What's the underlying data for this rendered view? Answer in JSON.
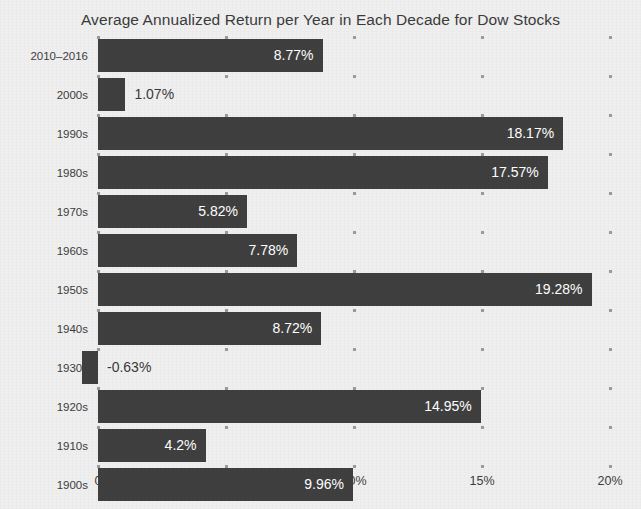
{
  "chart_data": {
    "type": "bar",
    "orientation": "horizontal",
    "title": "Average Annualized Return per Year in Each Decade for Dow Stocks",
    "xlabel": "",
    "ylabel": "",
    "xlim": [
      0,
      20
    ],
    "grid": "dotted-vertical",
    "legend": "none",
    "bar_color": "#3f3f3f",
    "background_color": "#efefef",
    "value_suffix": "%",
    "categories": [
      "2010–2016",
      "2000s",
      "1990s",
      "1980s",
      "1970s",
      "1960s",
      "1950s",
      "1940s",
      "1930s",
      "1920s",
      "1910s",
      "1900s"
    ],
    "values": [
      8.77,
      1.07,
      18.17,
      17.57,
      5.82,
      7.78,
      19.28,
      8.72,
      -0.63,
      14.95,
      4.2,
      9.96
    ],
    "data_labels": [
      "8.77%",
      "1.07%",
      "18.17%",
      "17.57%",
      "5.82%",
      "7.78%",
      "19.28%",
      "8.72%",
      "-0.63%",
      "14.95%",
      "4.2%",
      "9.96%"
    ],
    "label_placement": [
      "inside",
      "outside",
      "inside",
      "inside",
      "inside",
      "inside",
      "inside",
      "inside",
      "outside",
      "inside",
      "inside",
      "inside"
    ],
    "xticks": [
      0,
      5,
      10,
      15,
      20
    ],
    "xtick_labels": [
      "0",
      "5%",
      "10%",
      "15%",
      "20%"
    ]
  }
}
